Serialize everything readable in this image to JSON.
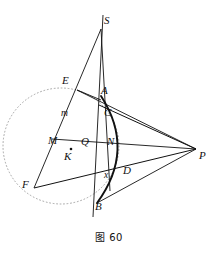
{
  "figure": {
    "caption": "图 60",
    "caption_number": "60",
    "kind": "plane-geometry-diagram",
    "background_color": "#ffffff",
    "stroke_color": "#111111",
    "dotted_circle_color": "#8a8a8a"
  },
  "points": [
    {
      "id": "S",
      "label": "S",
      "x": 101,
      "y": 29,
      "label_x": 104,
      "label_y": 16
    },
    {
      "id": "E",
      "label": "E",
      "x": 78,
      "y": 90,
      "label_x": 63,
      "label_y": 76
    },
    {
      "id": "A",
      "label": "A",
      "x": 101,
      "y": 97,
      "label_x": 101,
      "label_y": 86
    },
    {
      "id": "C",
      "label": "C",
      "x": 104,
      "y": 114,
      "label_x": 104,
      "label_y": 108
    },
    {
      "id": "m",
      "label": "m",
      "x": 68,
      "y": 115,
      "label_x": 62,
      "label_y": 110
    },
    {
      "id": "M",
      "label": "M",
      "x": 57,
      "y": 142,
      "label_x": 49,
      "label_y": 136
    },
    {
      "id": "Q",
      "label": "Q",
      "x": 96,
      "y": 146,
      "label_x": 82,
      "label_y": 137
    },
    {
      "id": "K",
      "label": "K",
      "x": 71,
      "y": 151,
      "label_x": 65,
      "label_y": 151
    },
    {
      "id": "N",
      "label": "N",
      "x": 112,
      "y": 147,
      "label_x": 108,
      "label_y": 137
    },
    {
      "id": "P",
      "label": "P",
      "x": 196,
      "y": 149,
      "label_x": 199,
      "label_y": 150
    },
    {
      "id": "F",
      "label": "F",
      "x": 34,
      "y": 188,
      "label_x": 23,
      "label_y": 180
    },
    {
      "id": "x",
      "label": "x",
      "x": 110,
      "y": 178,
      "label_x": 105,
      "label_y": 172
    },
    {
      "id": "D",
      "label": "D",
      "x": 124,
      "y": 175,
      "label_x": 124,
      "label_y": 166
    },
    {
      "id": "B",
      "label": "B",
      "x": 97,
      "y": 201,
      "label_x": 96,
      "label_y": 202
    }
  ],
  "segments": [
    {
      "name": "S-to-F-line",
      "from": "S",
      "to": "F",
      "width": 0.9
    },
    {
      "name": "S-to-B-line",
      "from": "S",
      "to": "B",
      "width": 0.9
    },
    {
      "name": "E-to-P-line",
      "from": "E",
      "to": "P",
      "width": 0.9
    },
    {
      "name": "C-to-P-line",
      "from": "C",
      "to": "P",
      "width": 0.9
    },
    {
      "name": "M-to-P-line",
      "from": "M",
      "to": "P",
      "width": 0.9
    },
    {
      "name": "F-to-P-line",
      "from": "F",
      "to": "P",
      "width": 0.9
    },
    {
      "name": "B-to-P-line",
      "from": "B",
      "to": "P",
      "width": 0.9
    },
    {
      "name": "vertical-axis-line",
      "from": "top",
      "to": "bottom",
      "width": 0.9
    }
  ],
  "circles": [
    {
      "name": "dotted-circle",
      "cx": 61,
      "cy": 146,
      "r": 58,
      "style": "dotted"
    }
  ],
  "arcs": [
    {
      "name": "thick-arc-A-to-B",
      "from": "A",
      "through": "N",
      "to": "B",
      "style": "thick"
    }
  ]
}
